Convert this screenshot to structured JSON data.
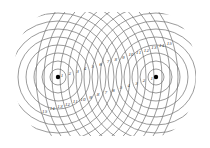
{
  "diagram": {
    "title": "",
    "background": "#ffffff",
    "line_color": "#707070",
    "dot_color": "#000000",
    "sources": [
      {
        "name": "left-source",
        "cx": 58,
        "cy": 77
      },
      {
        "name": "right-source",
        "cx": 156,
        "cy": 77
      }
    ],
    "ring_spacing": 8,
    "ring_count": 15,
    "clip": {
      "left": 14,
      "top": 12,
      "right": 196,
      "bottom": 136
    },
    "labels_left_source": [
      "1",
      "2",
      "3",
      "4",
      "5",
      "6",
      "7",
      "8",
      "9",
      "10",
      "11",
      "12",
      "13",
      "14",
      "15"
    ],
    "labels_right_source": [
      "1",
      "2",
      "3",
      "4",
      "5",
      "6",
      "7",
      "8",
      "9",
      "10",
      "11",
      "12",
      "13",
      "14",
      "15"
    ]
  }
}
